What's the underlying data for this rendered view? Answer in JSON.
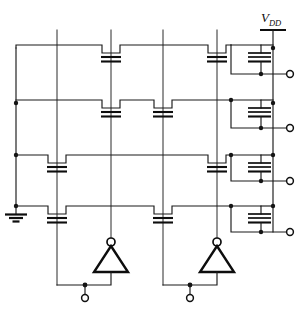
{
  "diagram": {
    "type": "circuit-schematic",
    "canvas": {
      "width": 308,
      "height": 309
    },
    "colors": {
      "background": "#ffffff",
      "wire": "#1a1a1a",
      "device": "#0d0d0d"
    }
  },
  "labels": {
    "vdd": "V",
    "vdd_subscript": "DD"
  },
  "power": {
    "rail_x": 273,
    "rail_top_y": 30,
    "rail_bottom_y": 228,
    "bar_y": 30,
    "bar_half_width": 13
  },
  "ground": {
    "x": 16,
    "stem_top_y": 206,
    "stem_bottom_y": 215,
    "bars": [
      {
        "y": 215,
        "half_width": 11
      },
      {
        "y": 218,
        "half_width": 7
      },
      {
        "y": 221,
        "half_width": 3.5
      }
    ]
  },
  "left_rail": {
    "x": 16,
    "top_y": 45,
    "bottom_y": 206,
    "junction_ys": [
      98,
      155,
      206
    ]
  },
  "word_lines": {
    "x_positions": [
      57,
      111,
      163,
      217
    ],
    "top_y": 30,
    "bottom_y_short": 259,
    "bottom_y_long": 285
  },
  "rows": [
    {
      "index": 0,
      "name": "row-1",
      "y": 48,
      "left_x": 16,
      "right_x": 231,
      "transistors": [
        {
          "on_line": 3,
          "x": 217
        },
        {
          "on_line": 1,
          "x": 111
        }
      ],
      "output_y": 74,
      "load": {
        "x": 248,
        "top_y": 48,
        "bottom_y": 74
      }
    },
    {
      "index": 1,
      "name": "row-2",
      "y": 103,
      "left_x": 16,
      "right_x": 231,
      "transistors": [
        {
          "on_line": 1,
          "x": 111
        },
        {
          "on_line": 2,
          "x": 163
        }
      ],
      "output_y": 128,
      "load": {
        "x": 248,
        "top_y": 103,
        "bottom_y": 128
      }
    },
    {
      "index": 2,
      "name": "row-3",
      "y": 155,
      "left_x": 16,
      "right_x": 231,
      "transistors": [
        {
          "on_line": 0,
          "x": 57
        },
        {
          "on_line": 3,
          "x": 217
        }
      ],
      "output_y": 181,
      "load": {
        "x": 248,
        "top_y": 155,
        "bottom_y": 181
      }
    },
    {
      "index": 3,
      "name": "row-4",
      "y": 206,
      "left_x": 16,
      "right_x": 231,
      "transistors": [
        {
          "on_line": 0,
          "x": 57
        },
        {
          "on_line": 2,
          "x": 163
        }
      ],
      "output_y": 232,
      "load": {
        "x": 248,
        "top_y": 206,
        "bottom_y": 232
      }
    }
  ],
  "outputs": [
    {
      "name": "output-1",
      "terminal_x": 290,
      "y": 74
    },
    {
      "name": "output-2",
      "terminal_x": 290,
      "y": 128
    },
    {
      "name": "output-3",
      "terminal_x": 290,
      "y": 181
    },
    {
      "name": "output-4",
      "terminal_x": 290,
      "y": 232
    }
  ],
  "inverters": [
    {
      "name": "inverter-left",
      "apex_x": 111,
      "apex_y": 242,
      "base_y": 272,
      "half_width": 17,
      "bubble_r": 4,
      "input_rail_y": 285,
      "input_rail_left_x": 57,
      "input_terminal_x": 85,
      "input_terminal_y": 298
    },
    {
      "name": "inverter-right",
      "apex_x": 217,
      "apex_y": 242,
      "base_y": 272,
      "half_width": 17,
      "bubble_r": 4,
      "input_rail_y": 285,
      "input_rail_left_x": 163,
      "input_terminal_x": 190,
      "input_terminal_y": 298
    }
  ],
  "device_geometry": {
    "pass_transistor": {
      "notch_half_width": 9,
      "notch_depth": 8,
      "plate_half_width": 10,
      "plate_gap": 4,
      "plate_offset": 10
    },
    "load_transistor": {
      "plate_half_width": 13,
      "plate_count": 3,
      "plate_spacing": 4,
      "channel_half_width": 13
    }
  }
}
